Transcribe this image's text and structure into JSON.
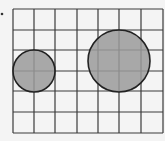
{
  "diagram": {
    "type": "grid-with-circles",
    "grid": {
      "columns": 7,
      "rows": 6,
      "x_lines": [
        13,
        34,
        55,
        77,
        98,
        119,
        141,
        163
      ],
      "y_lines": [
        9,
        30,
        50,
        71,
        91,
        112,
        133
      ],
      "line_color": "#3a3a3a"
    },
    "circles": [
      {
        "name": "small-circle",
        "cx": 34,
        "cy": 71,
        "r": 21,
        "fill": "#9a9a9a",
        "stroke": "#222222",
        "radius_cells": 1
      },
      {
        "name": "large-circle",
        "cx": 119,
        "cy": 61,
        "r": 31,
        "fill": "#9a9a9a",
        "stroke": "#222222",
        "radius_cells": 1.5
      }
    ],
    "bullet": {
      "x": 2,
      "y": 14
    }
  }
}
